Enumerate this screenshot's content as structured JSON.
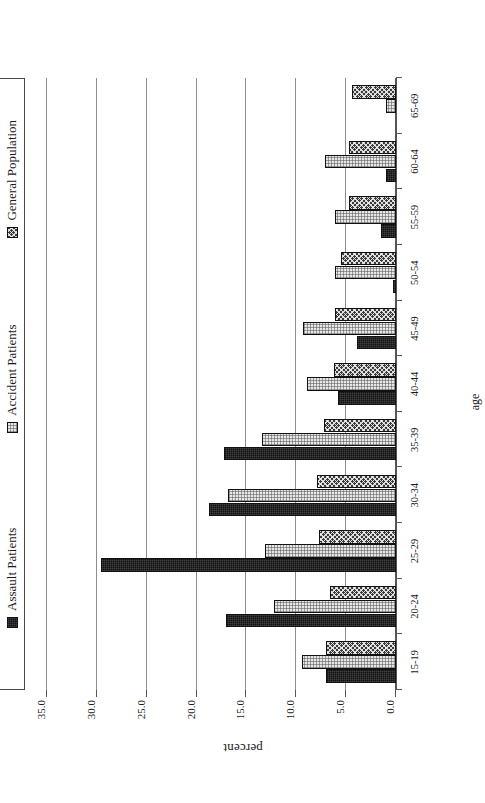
{
  "chart_data": {
    "type": "bar",
    "title": "",
    "xlabel": "age",
    "ylabel": "percent",
    "ylim": [
      0.0,
      35.0
    ],
    "ytick_labels": [
      "0.0",
      "5.0",
      "10.0",
      "15.0",
      "20.0",
      "25.0",
      "30.0",
      "35.0"
    ],
    "ytick_values": [
      0.0,
      5.0,
      10.0,
      15.0,
      20.0,
      25.0,
      30.0,
      35.0
    ],
    "grid": true,
    "orientation": "rotated-90-ccw",
    "legend_position": "top",
    "categories": [
      "15-19",
      "20-24",
      "25-29",
      "30-34",
      "35-39",
      "40-44",
      "45-49",
      "50-54",
      "55-59",
      "60-64",
      "65-69"
    ],
    "series": [
      {
        "name": "Assault Patients",
        "fill": "solid-black",
        "color": "#111111",
        "values": [
          7.0,
          17.1,
          29.6,
          18.8,
          17.3,
          5.8,
          3.9,
          0.3,
          1.5,
          1.0,
          0.0
        ]
      },
      {
        "name": "Accident Patients",
        "fill": "light-dotted",
        "color": "#e6e6e6",
        "values": [
          9.4,
          12.2,
          13.1,
          16.8,
          13.4,
          8.9,
          9.3,
          6.1,
          6.1,
          7.1,
          1.0
        ]
      },
      {
        "name": "General Population",
        "fill": "dark-crosshatch",
        "color": "#3b3b3b",
        "values": [
          7.0,
          6.6,
          7.7,
          7.9,
          7.2,
          6.2,
          6.1,
          5.5,
          4.7,
          4.7,
          4.4
        ]
      }
    ]
  },
  "legend": {
    "items": [
      {
        "label": "Assault Patients"
      },
      {
        "label": "Accident Patients"
      },
      {
        "label": "General Population"
      }
    ]
  }
}
